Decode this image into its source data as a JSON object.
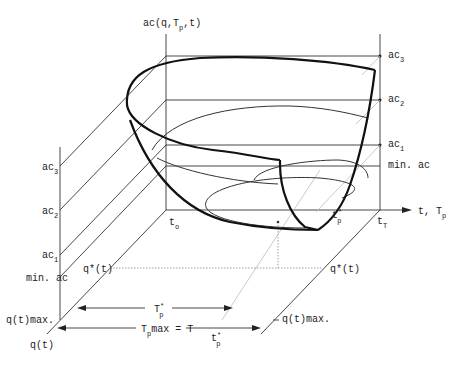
{
  "diagram": {
    "vertical_axis_label": {
      "main": "ac(q,T",
      "sub": "p",
      "tail": ",t)"
    },
    "horizontal_axis_label": {
      "main": "t, T",
      "sub": "p"
    },
    "depth_axis_label": "q(t)",
    "right_levels": [
      {
        "main": "ac",
        "sub": "3"
      },
      {
        "main": "ac",
        "sub": "2"
      },
      {
        "main": "ac",
        "sub": "1"
      },
      {
        "main": "min. ac",
        "sub": ""
      }
    ],
    "left_levels": [
      {
        "main": "ac",
        "sub": "3"
      },
      {
        "main": "ac",
        "sub": "2"
      },
      {
        "main": "ac",
        "sub": "1"
      },
      {
        "main": "min. ac",
        "sub": ""
      }
    ],
    "t0_label": {
      "main": "t",
      "sub": "o"
    },
    "tT_label": {
      "main": "t",
      "sub": "T"
    },
    "tp_star_label": {
      "main": "t",
      "sup": "*",
      "sub": "p"
    },
    "q_star_left": "q*(t)",
    "q_star_right": "q*(t)",
    "q_max_left": "q(t)max.",
    "q_max_right": "q(t)max.",
    "Tp_star_arrow": {
      "main": "T",
      "sup": "*",
      "sub": "p"
    },
    "Tp_max_arrow": {
      "main": "T",
      "sub": "p",
      "tail": "max = T"
    },
    "tp_star_bottom": {
      "main": "t",
      "sup": "*",
      "sub": "p"
    }
  }
}
